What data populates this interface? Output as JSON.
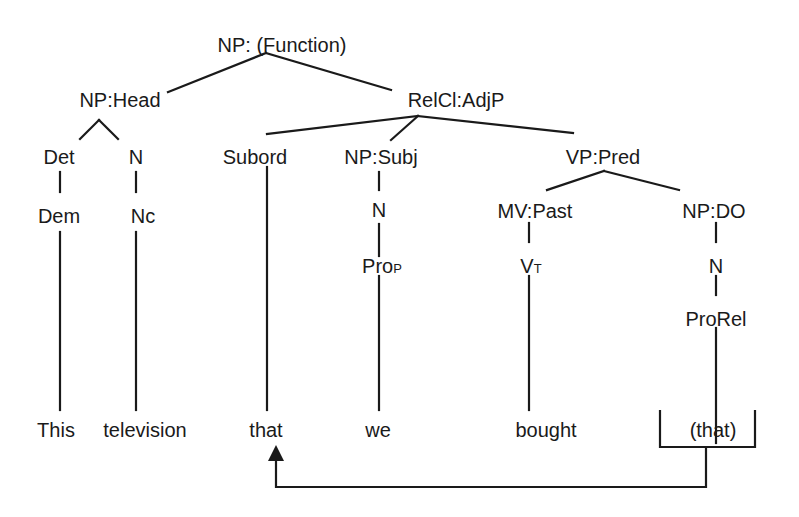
{
  "tree": {
    "root": "NP:  (Function)",
    "np_head": {
      "label": "NP:Head",
      "det": {
        "label": "Det",
        "cat": "Dem",
        "word": "This"
      },
      "n": {
        "label": "N",
        "cat": "Nc",
        "word": "television"
      }
    },
    "relcl": {
      "label": "RelCl:AdjP",
      "subord": {
        "label": "Subord",
        "word": "that"
      },
      "np_subj": {
        "label": "NP:Subj",
        "n": "N",
        "cat_main": "Pro",
        "cat_sub": "P",
        "word": "we"
      },
      "vp_pred": {
        "label": "VP:Pred",
        "mv": {
          "label": "MV:Past",
          "cat_main": "V",
          "cat_sub": "T",
          "word": "bought"
        },
        "np_do": {
          "label": "NP:DO",
          "n": "N",
          "cat": "ProRel",
          "word": "(that)"
        }
      }
    }
  },
  "colors": {
    "ink": "#1a1a1a",
    "background": "#ffffff"
  }
}
